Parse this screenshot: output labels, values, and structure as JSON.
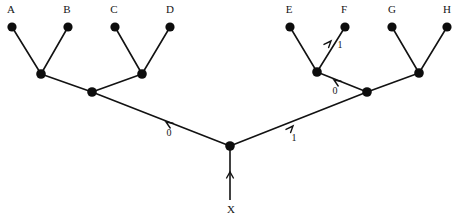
{
  "diagram": {
    "type": "binary-tree",
    "width": 458,
    "height": 220,
    "stroke_color": "#121212",
    "node_color": "#0d0d0d",
    "background_color": "#ffffff",
    "leaf_labels": [
      "A",
      "B",
      "C",
      "D",
      "E",
      "F",
      "G",
      "H"
    ],
    "source_label": "X",
    "edge_label_values": [
      "0",
      "1",
      "0",
      "1"
    ],
    "nodes": [
      {
        "id": "A",
        "label": "A",
        "x": 12,
        "y": 27,
        "r": 4.6,
        "kind": "leaf",
        "label_x": 11,
        "label_y": 13
      },
      {
        "id": "B",
        "label": "B",
        "x": 68,
        "y": 27,
        "r": 4.6,
        "kind": "leaf",
        "label_x": 67,
        "label_y": 13
      },
      {
        "id": "C",
        "label": "C",
        "x": 115,
        "y": 27,
        "r": 4.6,
        "kind": "leaf",
        "label_x": 114,
        "label_y": 13
      },
      {
        "id": "D",
        "label": "D",
        "x": 170,
        "y": 27,
        "r": 4.6,
        "kind": "leaf",
        "label_x": 170,
        "label_y": 13
      },
      {
        "id": "E",
        "label": "E",
        "x": 290,
        "y": 27,
        "r": 4.6,
        "kind": "leaf",
        "label_x": 289,
        "label_y": 13
      },
      {
        "id": "F",
        "label": "F",
        "x": 345,
        "y": 27,
        "r": 4.6,
        "kind": "leaf",
        "label_x": 344,
        "label_y": 13
      },
      {
        "id": "G",
        "label": "G",
        "x": 392,
        "y": 27,
        "r": 4.6,
        "kind": "leaf",
        "label_x": 392,
        "label_y": 13
      },
      {
        "id": "H",
        "label": "H",
        "x": 447,
        "y": 27,
        "r": 4.6,
        "kind": "leaf",
        "label_x": 447,
        "label_y": 13
      },
      {
        "id": "AB",
        "label": "",
        "x": 41,
        "y": 74,
        "r": 4.8,
        "kind": "internal",
        "label_x": 0,
        "label_y": 0
      },
      {
        "id": "CD",
        "label": "",
        "x": 142,
        "y": 74,
        "r": 4.8,
        "kind": "internal",
        "label_x": 0,
        "label_y": 0
      },
      {
        "id": "EF",
        "label": "",
        "x": 317,
        "y": 72,
        "r": 4.8,
        "kind": "internal",
        "label_x": 0,
        "label_y": 0
      },
      {
        "id": "GH",
        "label": "",
        "x": 419,
        "y": 73,
        "r": 4.8,
        "kind": "internal",
        "label_x": 0,
        "label_y": 0
      },
      {
        "id": "LEFT",
        "label": "",
        "x": 92,
        "y": 92,
        "r": 4.8,
        "kind": "internal",
        "label_x": 0,
        "label_y": 0
      },
      {
        "id": "RIGHT",
        "label": "",
        "x": 367,
        "y": 92,
        "r": 4.8,
        "kind": "internal",
        "label_x": 0,
        "label_y": 0
      },
      {
        "id": "ROOT",
        "label": "",
        "x": 230,
        "y": 146,
        "r": 4.8,
        "kind": "root",
        "label_x": 0,
        "label_y": 0
      }
    ],
    "edges": [
      {
        "id": "A-AB",
        "from": "A",
        "to": "AB",
        "x1": 12,
        "y1": 27,
        "x2": 41,
        "y2": 74
      },
      {
        "id": "B-AB",
        "from": "B",
        "to": "AB",
        "x1": 68,
        "y1": 27,
        "x2": 41,
        "y2": 74
      },
      {
        "id": "C-CD",
        "from": "C",
        "to": "CD",
        "x1": 115,
        "y1": 27,
        "x2": 142,
        "y2": 74
      },
      {
        "id": "D-CD",
        "from": "D",
        "to": "CD",
        "x1": 170,
        "y1": 27,
        "x2": 142,
        "y2": 74
      },
      {
        "id": "AB-LEFT",
        "from": "AB",
        "to": "LEFT",
        "x1": 41,
        "y1": 74,
        "x2": 92,
        "y2": 92
      },
      {
        "id": "CD-LEFT",
        "from": "CD",
        "to": "LEFT",
        "x1": 142,
        "y1": 74,
        "x2": 92,
        "y2": 92
      },
      {
        "id": "LEFT-ROOT",
        "from": "LEFT",
        "to": "ROOT",
        "x1": 92,
        "y1": 92,
        "x2": 230,
        "y2": 146
      },
      {
        "id": "E-EF",
        "from": "E",
        "to": "EF",
        "x1": 290,
        "y1": 27,
        "x2": 317,
        "y2": 72
      },
      {
        "id": "F-EF",
        "from": "F",
        "to": "EF",
        "x1": 345,
        "y1": 27,
        "x2": 317,
        "y2": 72
      },
      {
        "id": "G-GH",
        "from": "G",
        "to": "GH",
        "x1": 392,
        "y1": 27,
        "x2": 419,
        "y2": 73
      },
      {
        "id": "H-GH",
        "from": "H",
        "to": "GH",
        "x1": 447,
        "y1": 27,
        "x2": 419,
        "y2": 73
      },
      {
        "id": "EF-RIGHT",
        "from": "EF",
        "to": "RIGHT",
        "x1": 317,
        "y1": 72,
        "x2": 367,
        "y2": 92
      },
      {
        "id": "GH-RIGHT",
        "from": "GH",
        "to": "RIGHT",
        "x1": 419,
        "y1": 73,
        "x2": 367,
        "y2": 92
      },
      {
        "id": "RIGHT-ROOT",
        "from": "RIGHT",
        "to": "ROOT",
        "x1": 367,
        "y1": 92,
        "x2": 230,
        "y2": 146
      }
    ],
    "root_stem": {
      "x1": 230,
      "y1": 146,
      "x2": 230,
      "y2": 200,
      "arrow_tip_x": 230,
      "arrow_tip_y": 172,
      "direction": "up"
    },
    "source_label_pos": {
      "x": 231,
      "y": 213
    },
    "edge_labels": [
      {
        "id": "label-root-left",
        "value": "0",
        "x": 169,
        "y": 136,
        "edge": "LEFT-ROOT",
        "arrow_tip_x": 166,
        "arrow_tip_y": 122,
        "arrow_dir": "up-left"
      },
      {
        "id": "label-root-right",
        "value": "1",
        "x": 294,
        "y": 141,
        "edge": "RIGHT-ROOT",
        "arrow_tip_x": 293,
        "arrow_tip_y": 126,
        "arrow_dir": "up-right"
      },
      {
        "id": "label-ef-f",
        "value": "1",
        "x": 340,
        "y": 48,
        "edge": "F-EF",
        "arrow_tip_x": 331,
        "arrow_tip_y": 41,
        "arrow_dir": "up-right"
      },
      {
        "id": "label-right-ef",
        "value": "0",
        "x": 335,
        "y": 94,
        "edge": "EF-RIGHT",
        "arrow_tip_x": 334,
        "arrow_tip_y": 80,
        "arrow_dir": "up-left"
      }
    ]
  }
}
